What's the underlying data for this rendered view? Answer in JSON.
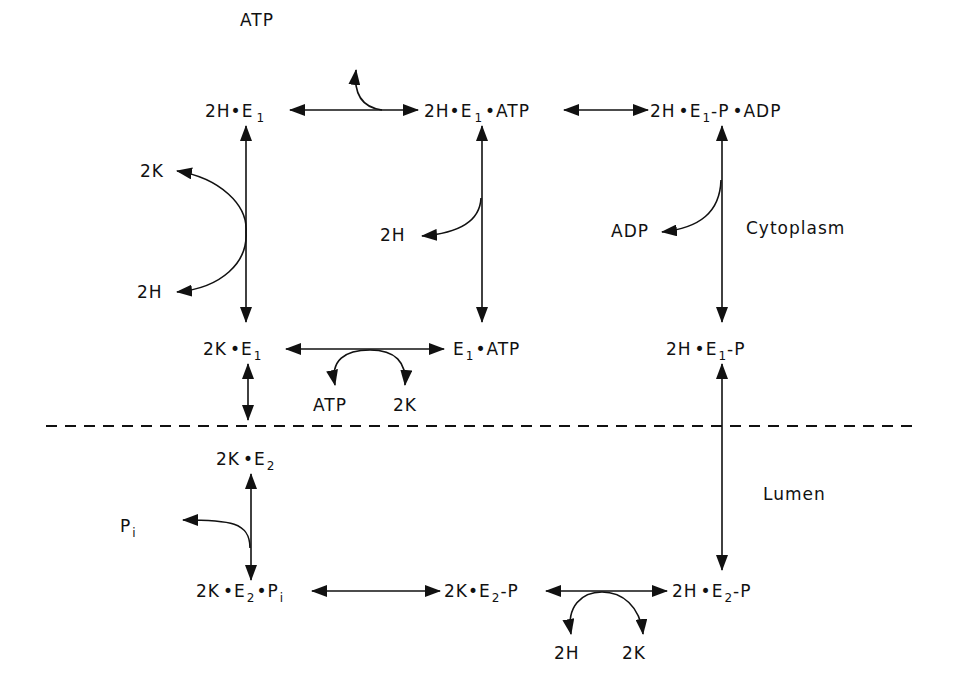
{
  "diagram": {
    "type": "reaction-cycle",
    "regions": {
      "cytoplasm": "Cytoplasm",
      "lumen": "Lumen"
    },
    "states": {
      "s1": {
        "pre": "2H",
        "e": "E",
        "sub": "1",
        "post": ""
      },
      "s2": {
        "pre": "2H",
        "e": "E",
        "sub": "1",
        "post": "ATP"
      },
      "s3": {
        "pre": "2H",
        "e": "E",
        "sub": "1",
        "post": "-P",
        "post2": "ADP"
      },
      "s4": {
        "pre": "2K",
        "e": "E",
        "sub": "1",
        "post": ""
      },
      "s5": {
        "pre": "",
        "e": "E",
        "sub": "1",
        "post": "ATP"
      },
      "s6": {
        "pre": "2H",
        "e": "E",
        "sub": "1",
        "post": "-P"
      },
      "s7": {
        "pre": "2K",
        "e": "E",
        "sub": "2",
        "post": ""
      },
      "s8": {
        "pre": "2K",
        "e": "E",
        "sub": "2",
        "post": "P",
        "post_sub": "i"
      },
      "s9": {
        "pre": "2K",
        "e": "E",
        "sub": "2",
        "post": "-P"
      },
      "s10": {
        "pre": "2H",
        "e": "E",
        "sub": "2",
        "post": "-P"
      }
    },
    "side_labels": {
      "atp_in_top": "ATP",
      "k_out": "2K",
      "h_in": "2H",
      "h_out_mid": "2H",
      "adp_out": "ADP",
      "atp_mid": "ATP",
      "k_mid": "2K",
      "pi_out": "P",
      "pi_sub": "i",
      "h_bottom": "2H",
      "k_bottom": "2K"
    },
    "edges": [
      {
        "from": "2H·E1",
        "to": "2H·E1·ATP",
        "with": "ATP"
      },
      {
        "from": "2H·E1·ATP",
        "to": "2H·E1-P·ADP"
      },
      {
        "from": "2H·E1",
        "to": "2K·E1",
        "with": [
          "2K",
          "2H"
        ]
      },
      {
        "from": "2H·E1·ATP",
        "to": "E1·ATP",
        "with": "2H"
      },
      {
        "from": "2H·E1-P·ADP",
        "to": "2H·E1-P",
        "with": "ADP"
      },
      {
        "from": "2K·E1",
        "to": "E1·ATP",
        "with": [
          "ATP",
          "2K"
        ]
      },
      {
        "from": "2K·E1",
        "to": "2K·E2"
      },
      {
        "from": "2H·E1-P",
        "to": "2H·E2-P"
      },
      {
        "from": "2K·E2",
        "to": "2K·E2·Pi",
        "with": "Pi"
      },
      {
        "from": "2K·E2·Pi",
        "to": "2K·E2-P"
      },
      {
        "from": "2K·E2-P",
        "to": "2H·E2-P",
        "with": [
          "2H",
          "2K"
        ]
      }
    ]
  }
}
